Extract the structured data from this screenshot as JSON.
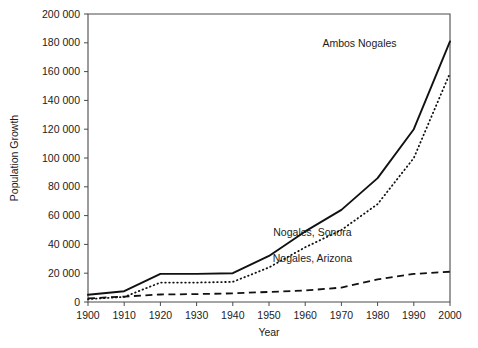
{
  "chart_data": {
    "type": "line",
    "title": "",
    "xlabel": "Year",
    "ylabel": "Population Growth",
    "xlim": [
      1900,
      2000
    ],
    "ylim": [
      0,
      200000
    ],
    "grid": false,
    "legend_position": "inline-annotations",
    "x": [
      1900,
      1910,
      1920,
      1930,
      1940,
      1950,
      1960,
      1970,
      1980,
      1990,
      2000
    ],
    "xticks": [
      "1900",
      "1910",
      "1920",
      "1930",
      "1940",
      "1950",
      "1960",
      "1970",
      "1980",
      "1990",
      "2000"
    ],
    "yticks": [
      "0",
      "20 000",
      "40 000",
      "60 000",
      "80 000",
      "100 000",
      "120 000",
      "140 000",
      "160 000",
      "180 000",
      "200 000"
    ],
    "ytick_values": [
      0,
      20000,
      40000,
      60000,
      80000,
      100000,
      120000,
      140000,
      160000,
      180000,
      200000
    ],
    "series": [
      {
        "name": "Ambos Nogales",
        "style": "solid",
        "values": [
          5000,
          7500,
          19500,
          19500,
          20000,
          32000,
          49000,
          64000,
          86000,
          120000,
          181000
        ]
      },
      {
        "name": "Nogales, Sonora",
        "style": "dotted",
        "values": [
          2000,
          3500,
          13500,
          13500,
          14000,
          24000,
          38000,
          50000,
          68000,
          100000,
          159000
        ]
      },
      {
        "name": "Nogales, Arizona",
        "style": "dashed",
        "values": [
          2500,
          3800,
          5200,
          5500,
          6000,
          7000,
          8000,
          10000,
          15700,
          19500,
          21000
        ]
      }
    ],
    "annotations": [
      {
        "text": "Ambos Nogales",
        "x": 1975,
        "y": 177000
      },
      {
        "text": "Nogales, Sonora",
        "x": 1962,
        "y": 46000
      },
      {
        "text": "Nogales, Arizona",
        "x": 1962,
        "y": 28000
      }
    ]
  },
  "axes": {
    "y_title": "Population Growth",
    "x_title": "Year"
  },
  "labels": {
    "ambos": "Ambos Nogales",
    "sonora": "Nogales, Sonora",
    "arizona": "Nogales, Arizona"
  }
}
